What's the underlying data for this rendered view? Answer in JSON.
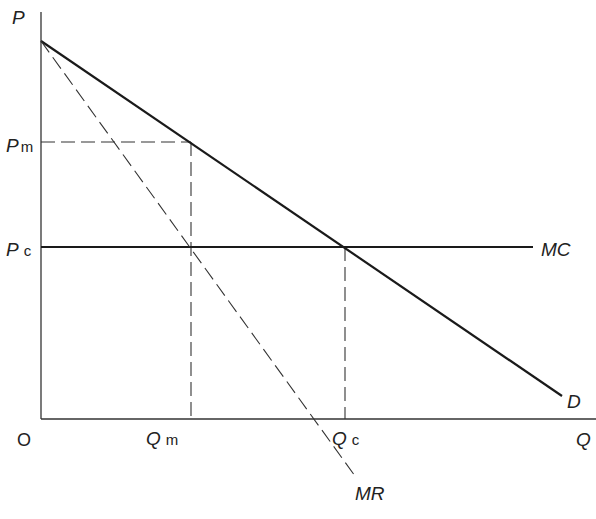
{
  "diagram": {
    "type": "monopoly vs competitive pricing",
    "axes": {
      "y_label": "P",
      "x_label": "Q",
      "origin_label": "O"
    },
    "price_levels": [
      {
        "id": "pm",
        "main": "P",
        "sub": "m"
      },
      {
        "id": "pc",
        "main": "P",
        "sub": "c"
      }
    ],
    "quantity_levels": [
      {
        "id": "qm",
        "main": "Q",
        "sub": "m"
      },
      {
        "id": "qc",
        "main": "Q",
        "sub": "c"
      }
    ],
    "curves": {
      "demand": "D",
      "marginal_revenue": "MR",
      "marginal_cost": "MC"
    },
    "colors": {
      "line": "#1a1a1a",
      "background": "#ffffff"
    }
  }
}
